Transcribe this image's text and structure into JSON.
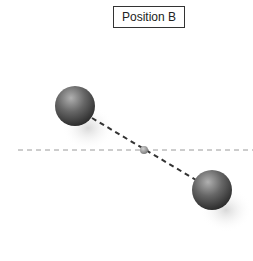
{
  "diagram": {
    "label": "Position B",
    "colors": {
      "sphere_dark": "#3a3a3a",
      "sphere_light": "#a8a8a8",
      "axis_line": "#9a9a9a",
      "bond_line": "#333333",
      "center_dot": "#8a8a8a"
    },
    "spheres": [
      {
        "name": "upper-left-sphere",
        "cx": 75,
        "cy": 106,
        "r": 20
      },
      {
        "name": "lower-right-sphere",
        "cx": 212,
        "cy": 190,
        "r": 20
      }
    ],
    "center_point": {
      "cx": 144,
      "cy": 150,
      "r": 4
    },
    "horizontal_axis": {
      "x1": 18,
      "x2": 253,
      "y": 150
    }
  }
}
